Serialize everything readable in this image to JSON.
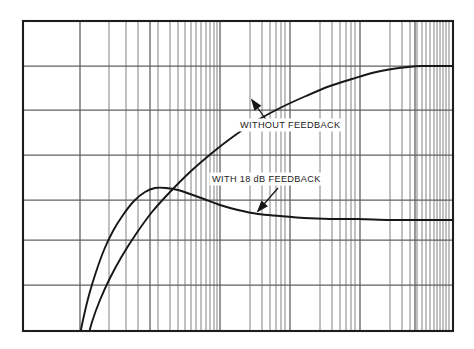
{
  "figure": {
    "title": "",
    "background_color": "#ffffff",
    "frame_color": "#1d1d1d",
    "grid_color": "#6e6e6e",
    "curve_color": "#171717"
  },
  "annotations": {
    "without_feedback": {
      "text": "WITHOUT FEEDBACK",
      "x": 240,
      "y": 128,
      "arrow_from": [
        267,
        121
      ],
      "arrow_to": [
        252,
        100
      ]
    },
    "with_feedback": {
      "text": "WITH 18 dB FEEDBACK",
      "x": 212,
      "y": 182,
      "arrow_from": [
        278,
        188
      ],
      "arrow_to": [
        258,
        211
      ]
    }
  },
  "chart_data": {
    "type": "line",
    "title": "",
    "subtitle": "",
    "xlabel": "",
    "ylabel": "",
    "xscale": "log",
    "grid": true,
    "legend_position": "inline-annotations",
    "axis": {
      "x_pixel_range": [
        23,
        453
      ],
      "y_pixel_range": [
        21,
        331
      ],
      "x_decades": 3,
      "x_major_gridlines_px": [
        23,
        80,
        150,
        220,
        290,
        360,
        415,
        453
      ],
      "x_minor_gridlines_px": [
        109,
        126,
        138,
        158,
        170,
        178,
        185,
        191,
        196,
        201,
        206,
        210,
        214,
        217,
        250,
        262,
        270,
        276,
        281,
        285,
        320,
        332,
        340,
        346,
        351,
        355,
        390,
        402,
        410,
        417,
        422,
        426,
        430,
        434,
        437,
        440,
        443,
        446,
        449
      ],
      "y_gridlines_px": [
        21,
        66,
        110,
        155,
        200,
        240,
        285,
        331
      ]
    },
    "series": [
      {
        "name": "WITHOUT FEEDBACK",
        "label": "WITHOUT FEEDBACK",
        "points_px": [
          [
            86,
            345
          ],
          [
            92,
            322
          ],
          [
            100,
            300
          ],
          [
            110,
            278
          ],
          [
            122,
            256
          ],
          [
            136,
            234
          ],
          [
            152,
            212
          ],
          [
            170,
            192
          ],
          [
            190,
            172
          ],
          [
            212,
            153
          ],
          [
            234,
            136
          ],
          [
            258,
            120
          ],
          [
            282,
            107
          ],
          [
            306,
            96
          ],
          [
            330,
            86
          ],
          [
            352,
            79
          ],
          [
            372,
            73
          ],
          [
            392,
            69
          ],
          [
            408,
            67
          ],
          [
            422,
            66
          ],
          [
            436,
            66
          ],
          [
            453,
            66
          ]
        ],
        "asymptote_px_y": 66,
        "note": "rises monotonically to a flat high-frequency plateau"
      },
      {
        "name": "WITH 18 dB FEEDBACK",
        "label": "WITH 18 dB FEEDBACK",
        "points_px": [
          [
            78,
            345
          ],
          [
            83,
            320
          ],
          [
            89,
            295
          ],
          [
            96,
            272
          ],
          [
            104,
            250
          ],
          [
            113,
            231
          ],
          [
            123,
            215
          ],
          [
            134,
            201
          ],
          [
            145,
            192
          ],
          [
            155,
            188
          ],
          [
            166,
            188
          ],
          [
            178,
            190
          ],
          [
            190,
            194
          ],
          [
            204,
            199
          ],
          [
            220,
            205
          ],
          [
            238,
            210
          ],
          [
            258,
            214
          ],
          [
            280,
            216
          ],
          [
            304,
            218
          ],
          [
            330,
            219
          ],
          [
            358,
            219
          ],
          [
            390,
            220
          ],
          [
            420,
            220
          ],
          [
            453,
            220
          ]
        ],
        "peak_px": [
          155,
          188
        ],
        "asymptote_px_y": 220,
        "note": "peaks early then settles to a lower flat plateau"
      }
    ]
  }
}
